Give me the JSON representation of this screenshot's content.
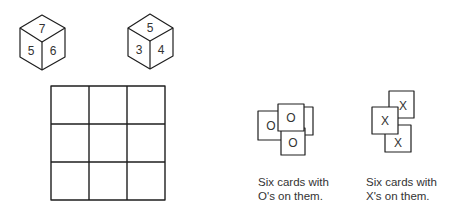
{
  "dice": [
    {
      "id": "die-1",
      "top": "7",
      "left": "5",
      "right": "6"
    },
    {
      "id": "die-2",
      "top": "5",
      "left": "3",
      "right": "4"
    }
  ],
  "board": {
    "rows": 3,
    "cols": 3
  },
  "o_cards": {
    "symbol": "O",
    "visible_cards": [
      "O",
      "O",
      "O"
    ],
    "caption_line1": "Six cards with",
    "caption_line2": "O's on them."
  },
  "x_cards": {
    "symbol": "X",
    "visible_cards": [
      "X",
      "X",
      "X"
    ],
    "caption_line1": "Six cards with",
    "caption_line2": "X's on them."
  },
  "colors": {
    "stroke": "#1e1e1e",
    "background": "#ffffff"
  }
}
